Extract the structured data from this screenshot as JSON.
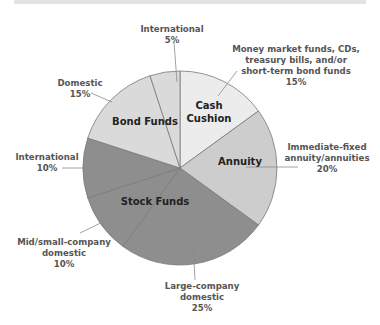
{
  "chart_data": {
    "type": "pie",
    "title": "",
    "start_angle_deg": 0,
    "direction": "clockwise",
    "groups": [
      {
        "name": "Cash Cushion",
        "color": "#ececec"
      },
      {
        "name": "Annuity",
        "color": "#cdcdcd"
      },
      {
        "name": "Stock Funds",
        "color": "#8e8e8e"
      },
      {
        "name": "Bond Funds",
        "color": "#dadada"
      }
    ],
    "slices": [
      {
        "label": "Money market funds, CDs, treasury bills, and/or short-term bond funds",
        "group": "Cash Cushion",
        "value": 15,
        "color": "#ececec"
      },
      {
        "label": "Immediate-fixed annuity/annuities",
        "group": "Annuity",
        "value": 20,
        "color": "#cdcdcd"
      },
      {
        "label": "Large-company domestic",
        "group": "Stock Funds",
        "value": 25,
        "color": "#8e8e8e"
      },
      {
        "label": "Mid/small-company domestic",
        "group": "Stock Funds",
        "value": 10,
        "color": "#8e8e8e"
      },
      {
        "label": "International",
        "group": "Stock Funds",
        "value": 10,
        "color": "#8e8e8e"
      },
      {
        "label": "Domestic",
        "group": "Bond Funds",
        "value": 15,
        "color": "#dadada"
      },
      {
        "label": "International",
        "group": "Bond Funds",
        "value": 5,
        "color": "#dadada"
      }
    ]
  },
  "labels": {
    "inner": {
      "cash_line1": "Cash",
      "cash_line2": "Cushion",
      "annuity": "Annuity",
      "stock": "Stock Funds",
      "bond": "Bond Funds"
    },
    "outer": {
      "intl_bond": {
        "line1": "International",
        "line2": "5%"
      },
      "cash": {
        "line1": "Money market funds, CDs,",
        "line2": "treasury bills, and/or",
        "line3": "short-term bond funds",
        "line4": "15%"
      },
      "annuity": {
        "line1": "Immediate-fixed",
        "line2": "annuity/annuities",
        "line3": "20%"
      },
      "dom_bond": {
        "line1": "Domestic",
        "line2": "15%"
      },
      "intl_stock": {
        "line1": "International",
        "line2": "10%"
      },
      "midsmall": {
        "line1": "Mid/small-company",
        "line2": "domestic",
        "line3": "10%"
      },
      "large": {
        "line1": "Large-company",
        "line2": "domestic",
        "line3": "25%"
      }
    }
  }
}
